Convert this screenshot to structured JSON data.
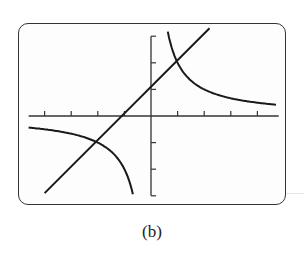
{
  "caption": "(b)",
  "chart_data": {
    "type": "line",
    "title": "",
    "caption": "(b)",
    "xlabel": "",
    "ylabel": "",
    "xlim": [
      -4.6,
      4.8
    ],
    "ylim": [
      -3,
      3
    ],
    "xticks": [
      -4,
      -3,
      -2,
      -1,
      1,
      2,
      3,
      4
    ],
    "yticks": [
      -3,
      -2,
      -1,
      1,
      2,
      3
    ],
    "grid": false,
    "legend": null,
    "series": [
      {
        "name": "line y = x + 1",
        "x": [
          -4,
          -3,
          -2,
          -1,
          0,
          1,
          2
        ],
        "y": [
          -3,
          -2,
          -1,
          0,
          1,
          2,
          3
        ]
      },
      {
        "name": "hyperbola y = 2/x (left branch)",
        "x": [
          -4.6,
          -4,
          -3,
          -2,
          -1.5,
          -1,
          -0.67
        ],
        "y": [
          -0.43,
          -0.5,
          -0.67,
          -1,
          -1.33,
          -2,
          -3
        ]
      },
      {
        "name": "hyperbola y = 2/x (right branch)",
        "x": [
          0.67,
          1,
          1.5,
          2,
          3,
          4,
          4.8
        ],
        "y": [
          3,
          2,
          1.33,
          1,
          0.67,
          0.5,
          0.42
        ]
      }
    ],
    "intersections": [
      {
        "x": 1,
        "y": 2
      },
      {
        "x": -2,
        "y": -1
      }
    ],
    "colors": {
      "curve": "#1a1a1a",
      "axis": "#333333",
      "frame": "#333333"
    }
  }
}
